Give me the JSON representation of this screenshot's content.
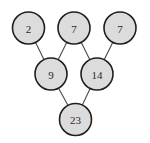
{
  "diagram": {
    "type": "addition-pyramid",
    "background_color": "#ffffff",
    "node_fill_color": "#dcdcdc",
    "node_stroke_color": "#1f1f1f",
    "node_text_color": "#2b2b2b",
    "edge_color": "#4a4a4a",
    "node_radius": 16,
    "node_stroke_width": 1.6,
    "edge_stroke_width": 1.1,
    "rows": [
      {
        "name": "top-row",
        "nodes": [
          {
            "id": "n2",
            "value": "2",
            "cx": 28.5,
            "cy": 28
          },
          {
            "id": "n7a",
            "value": "7",
            "cx": 74,
            "cy": 28
          },
          {
            "id": "n7b",
            "value": "7",
            "cx": 120,
            "cy": 28
          }
        ]
      },
      {
        "name": "middle-row",
        "nodes": [
          {
            "id": "n9",
            "value": "9",
            "cx": 51,
            "cy": 74
          },
          {
            "id": "n14",
            "value": "14",
            "cx": 97,
            "cy": 74
          }
        ]
      },
      {
        "name": "bottom-row",
        "nodes": [
          {
            "id": "n23",
            "value": "23",
            "cx": 75.5,
            "cy": 119.5
          }
        ]
      }
    ],
    "edges": [
      {
        "id": "e-2-9",
        "from": "n2",
        "to": "n9"
      },
      {
        "id": "e-7a-9",
        "from": "n7a",
        "to": "n9"
      },
      {
        "id": "e-7a-14",
        "from": "n7a",
        "to": "n14"
      },
      {
        "id": "e-7b-14",
        "from": "n7b",
        "to": "n14"
      },
      {
        "id": "e-9-23",
        "from": "n9",
        "to": "n23"
      },
      {
        "id": "e-14-23",
        "from": "n14",
        "to": "n23"
      }
    ]
  },
  "chart_data": {
    "type": "diagram",
    "levels": [
      {
        "level": 1,
        "values": [
          2,
          7,
          7
        ]
      },
      {
        "level": 2,
        "values": [
          9,
          14
        ]
      },
      {
        "level": 3,
        "values": [
          23
        ]
      }
    ],
    "relations": [
      "2 + 7 = 9",
      "7 + 7 = 14",
      "9 + 14 = 23"
    ]
  }
}
